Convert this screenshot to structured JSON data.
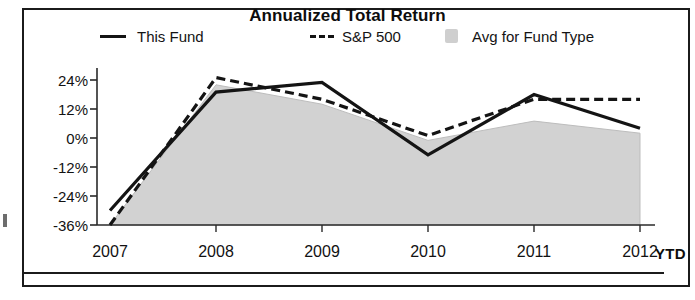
{
  "chart_data": {
    "type": "line",
    "title": "Annualized Total Return",
    "xlabel": "",
    "ylabel": "",
    "x": [
      "2007",
      "2008",
      "2009",
      "2010",
      "2011",
      "2012"
    ],
    "x_axis_suffix": "YTD",
    "categories": [
      "2007",
      "2008",
      "2009",
      "2010",
      "2011",
      "2012"
    ],
    "ylim": [
      -36,
      30
    ],
    "ytick_labels": [
      "24%",
      "12%",
      "0%",
      "-12%",
      "-24%",
      "-36%"
    ],
    "ytick_values": [
      24,
      12,
      0,
      -12,
      -24,
      -36
    ],
    "grid": false,
    "legend_position": "top",
    "series": [
      {
        "name": "This Fund",
        "style": "solid",
        "color": "#141414",
        "values": [
          -30,
          19,
          23,
          -7,
          18,
          4
        ]
      },
      {
        "name": "S&P 500",
        "style": "dashed",
        "color": "#141414",
        "values": [
          -36,
          25,
          16,
          1,
          16,
          16
        ]
      },
      {
        "name": "Avg for Fund Type",
        "style": "area",
        "color": "#d2d2d2",
        "values": [
          -36,
          22,
          14,
          -1,
          7,
          2
        ]
      }
    ]
  },
  "chart": {
    "title": "Annualized Total Return"
  },
  "legend": {
    "items": [
      {
        "label": "This Fund",
        "swatch": "solid-line"
      },
      {
        "label": "S&P 500",
        "swatch": "dashed-line"
      },
      {
        "label": "Avg for Fund Type",
        "swatch": "area-fill"
      }
    ]
  },
  "axes": {
    "y_labels": [
      "24%",
      "12%",
      "0%",
      "-12%",
      "-24%",
      "-36%"
    ],
    "x_labels": [
      "2007",
      "2008",
      "2009",
      "2010",
      "2011",
      "2012"
    ],
    "x_suffix": "YTD"
  },
  "colors": {
    "line": "#141414",
    "area": "#d2d2d2",
    "frame": "#1b1b1b",
    "text": "#121212"
  }
}
